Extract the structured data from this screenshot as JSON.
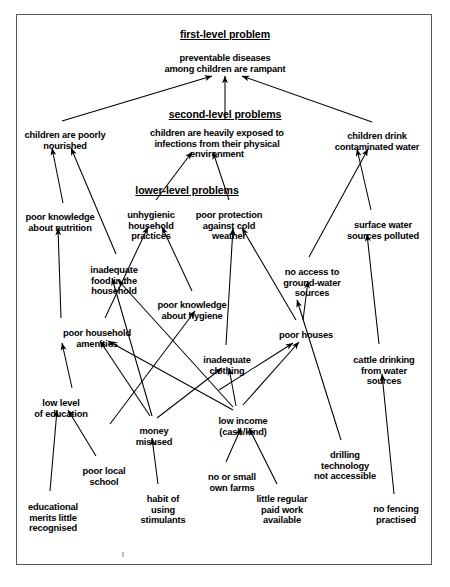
{
  "diagram": {
    "frame": {
      "border_color": "#5a5a5a"
    },
    "headers": [
      {
        "id": "h1",
        "text": "first-level problem",
        "x": 225,
        "y": 28
      },
      {
        "id": "h2",
        "text": "second-level problems",
        "x": 225,
        "y": 108
      },
      {
        "id": "h3",
        "text": "lower-level problems",
        "x": 187,
        "y": 184
      }
    ],
    "nodes": [
      {
        "id": "n-preventable",
        "text": "preventable diseases\namong children are rampant",
        "x": 225,
        "y": 53,
        "w": 170
      },
      {
        "id": "n-poorly-nour",
        "text": "children are poorly\nnourished",
        "x": 65,
        "y": 130,
        "w": 110
      },
      {
        "id": "n-infections",
        "text": "children are heavily exposed to\ninfections from their physical\nenvironment",
        "x": 217,
        "y": 128,
        "w": 155
      },
      {
        "id": "n-drink-water",
        "text": "children drink\ncontaminated water",
        "x": 377,
        "y": 131,
        "w": 105
      },
      {
        "id": "n-know-nutr",
        "text": "poor knowledge\nabout nutrition",
        "x": 60,
        "y": 212,
        "w": 95
      },
      {
        "id": "n-unhygienic",
        "text": "unhygienic\nhousehold\npractices",
        "x": 151,
        "y": 210,
        "w": 70
      },
      {
        "id": "n-cold",
        "text": "poor protection\nagainst cold\nweather",
        "x": 229,
        "y": 210,
        "w": 85
      },
      {
        "id": "n-surface",
        "text": "surface water\nsources polluted",
        "x": 383,
        "y": 220,
        "w": 100
      },
      {
        "id": "n-inadeq-food",
        "text": "inadequate\nfood in the\nhousehold",
        "x": 114,
        "y": 265,
        "w": 72
      },
      {
        "id": "n-noaccess",
        "text": "no access to\nground-water\nsources",
        "x": 312,
        "y": 267,
        "w": 80
      },
      {
        "id": "n-know-hyg",
        "text": "poor knowledge\nabout hygiene",
        "x": 192,
        "y": 300,
        "w": 95
      },
      {
        "id": "n-amenities",
        "text": "poor household\namenities",
        "x": 97,
        "y": 328,
        "w": 95
      },
      {
        "id": "n-houses",
        "text": "poor houses",
        "x": 306,
        "y": 330,
        "w": 75
      },
      {
        "id": "n-cattle",
        "text": "cattle drinking\nfrom water\nsources",
        "x": 384,
        "y": 355,
        "w": 85
      },
      {
        "id": "n-clothing",
        "text": "inadequate\nclothing",
        "x": 227,
        "y": 355,
        "w": 72
      },
      {
        "id": "n-low-edu",
        "text": "low level\nof education",
        "x": 61,
        "y": 398,
        "w": 80
      },
      {
        "id": "n-low-income",
        "text": "low income\n(cash/kind)",
        "x": 243,
        "y": 416,
        "w": 75
      },
      {
        "id": "n-money",
        "text": "money\nmisused",
        "x": 154,
        "y": 426,
        "w": 60
      },
      {
        "id": "n-drilling",
        "text": "drilling\ntechnology\nnot accessible",
        "x": 345,
        "y": 450,
        "w": 85
      },
      {
        "id": "n-poor-school",
        "text": "poor local\nschool",
        "x": 104,
        "y": 466,
        "w": 70
      },
      {
        "id": "n-small-farms",
        "text": "no or small\nown farms",
        "x": 232,
        "y": 472,
        "w": 70
      },
      {
        "id": "n-edu-merits",
        "text": "educational\nmerits little\nrecognised",
        "x": 53,
        "y": 502,
        "w": 75
      },
      {
        "id": "n-stimulants",
        "text": "habit of\nusing\nstimulants",
        "x": 163,
        "y": 494,
        "w": 62
      },
      {
        "id": "n-little-work",
        "text": "little regular\npaid work\navailable",
        "x": 282,
        "y": 494,
        "w": 75
      },
      {
        "id": "n-no-fencing",
        "text": "no fencing\npractised",
        "x": 396,
        "y": 504,
        "w": 70
      }
    ],
    "links": [
      {
        "from": "n-poorly-nour",
        "to": "n-preventable",
        "path": "M 62,121 L 212,76"
      },
      {
        "from": "n-infections",
        "to": "n-preventable",
        "path": "M 225,120 L 225,76"
      },
      {
        "from": "n-drink-water",
        "to": "n-preventable",
        "path": "M 372,122 L 242,76"
      },
      {
        "from": "n-know-nutr",
        "to": "n-poorly-nour",
        "path": "M 63,203 L 52,148"
      },
      {
        "from": "n-inadeq-food",
        "to": "n-poorly-nour",
        "path": "M 116,254 L 71,148"
      },
      {
        "from": "n-unhygienic",
        "to": "n-infections",
        "path": "M 156,200 L 192,152"
      },
      {
        "from": "n-cold",
        "to": "n-infections",
        "path": "M 229,200 L 213,152"
      },
      {
        "from": "n-surface",
        "to": "n-drink-water",
        "path": "M 371,210 L 357,149"
      },
      {
        "from": "n-noaccess",
        "to": "n-drink-water",
        "path": "M 309,257 L 368,149"
      },
      {
        "from": "n-amenities",
        "to": "n-know-nutr",
        "path": "M 61,318 L 58,228"
      },
      {
        "from": "n-money",
        "to": "n-inadeq-food",
        "path": "M 152,416 L 112,278"
      },
      {
        "from": "n-low-income",
        "to": "n-inadeq-food",
        "path": "M 233,407 L 118,280"
      },
      {
        "from": "n-know-hyg",
        "to": "n-unhygienic",
        "path": "M 192,291 L 162,227"
      },
      {
        "from": "n-amenities",
        "to": "n-unhygienic",
        "path": "M 105,318 L 148,227"
      },
      {
        "from": "n-money",
        "to": "n-know-hyg",
        "path": "M 110,424 L 195,311"
      },
      {
        "from": "n-clothing",
        "to": "n-cold",
        "path": "M 226,345 L 233,228"
      },
      {
        "from": "n-houses",
        "to": "n-cold",
        "path": "M 296,320 L 242,228"
      },
      {
        "from": "n-cattle",
        "to": "n-surface",
        "path": "M 379,344 L 367,234"
      },
      {
        "from": "n-houses",
        "to": "n-noaccess",
        "path": "M 303,320 L 308,281"
      },
      {
        "from": "n-drilling",
        "to": "n-noaccess",
        "path": "M 341,440 L 297,300"
      },
      {
        "from": "n-low-income",
        "to": "n-amenities",
        "path": "M 233,410 L 108,341"
      },
      {
        "from": "n-money",
        "to": "n-amenities",
        "path": "M 150,416 L 100,341"
      },
      {
        "from": "n-low-income",
        "to": "n-clothing",
        "path": "M 236,406 L 229,368"
      },
      {
        "from": "n-money",
        "to": "n-clothing",
        "path": "M 157,418 L 222,368"
      },
      {
        "from": "n-low-income",
        "to": "n-houses",
        "path": "M 243,405 L 299,342"
      },
      {
        "from": "n-clothing",
        "to": "n-houses",
        "path": "M 219,390 L 293,343"
      },
      {
        "from": "n-edu-merits",
        "to": "n-low-edu",
        "path": "M 50,491 L 57,410"
      },
      {
        "from": "n-poor-school",
        "to": "n-low-edu",
        "path": "M 96,456 L 68,410"
      },
      {
        "from": "n-stimulants",
        "to": "n-money",
        "path": "M 158,484 L 152,438"
      },
      {
        "from": "n-small-farms",
        "to": "n-low-income",
        "path": "M 226,462 L 241,428"
      },
      {
        "from": "n-little-work",
        "to": "n-low-income",
        "path": "M 277,484 L 249,428"
      },
      {
        "from": "n-no-fencing",
        "to": "n-cattle",
        "path": "M 394,494 L 382,374"
      },
      {
        "from": "n-low-edu",
        "to": "n-amenities",
        "path": "M 72,388 L 62,343"
      }
    ]
  }
}
